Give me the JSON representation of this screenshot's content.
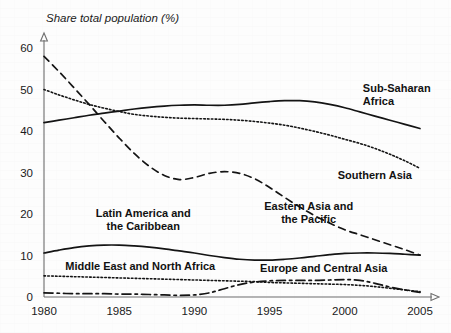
{
  "chart_data": {
    "type": "line",
    "title": "Share total population (%)",
    "xlabel": "",
    "ylabel": "Share total population (%)",
    "xlim": [
      1980,
      2005
    ],
    "ylim": [
      0,
      63
    ],
    "grid": false,
    "legend": "inline-annotations",
    "x_ticks": [
      "1980",
      "1985",
      "1990",
      "1995",
      "2000",
      "2005"
    ],
    "x_tick_values": [
      1980,
      1985,
      1990,
      1995,
      2000,
      2005
    ],
    "y_ticks": [
      "0",
      "10",
      "20",
      "30",
      "40",
      "50",
      "60"
    ],
    "y_tick_values": [
      0,
      10,
      20,
      30,
      40,
      50,
      60
    ],
    "x": [
      1980,
      1981,
      1982,
      1983,
      1984,
      1985,
      1986,
      1987,
      1988,
      1989,
      1990,
      1991,
      1992,
      1993,
      1994,
      1995,
      1996,
      1997,
      1998,
      1999,
      2000,
      2001,
      2002,
      2003,
      2004,
      2005
    ],
    "series": [
      {
        "name": "Sub-Saharan Africa",
        "style": "solid",
        "label_lines": [
          "Sub-Saharan",
          "Africa"
        ],
        "values": [
          42.0,
          42.6,
          43.2,
          43.8,
          44.3,
          44.8,
          45.3,
          45.7,
          46.0,
          46.2,
          46.3,
          46.2,
          46.2,
          46.4,
          46.8,
          47.1,
          47.3,
          47.3,
          47.0,
          46.4,
          45.6,
          44.6,
          43.6,
          42.6,
          41.6,
          40.6
        ]
      },
      {
        "name": "Southern Asia",
        "style": "dotted",
        "label_lines": [
          "Southern Asia"
        ],
        "values": [
          50.0,
          48.7,
          47.5,
          46.4,
          45.5,
          44.7,
          44.0,
          43.6,
          43.3,
          43.1,
          43.0,
          42.9,
          42.8,
          42.6,
          42.3,
          41.9,
          41.4,
          40.7,
          39.9,
          39.0,
          38.0,
          37.0,
          35.8,
          34.4,
          32.8,
          31.0
        ]
      },
      {
        "name": "Eastern Asia and the Pacific",
        "style": "dashed",
        "label_lines": [
          "Eastern Asia and",
          "the Pacific"
        ],
        "values": [
          58.0,
          54.3,
          50.4,
          46.4,
          42.3,
          38.3,
          34.6,
          31.5,
          29.3,
          28.3,
          28.8,
          29.8,
          30.2,
          29.8,
          28.5,
          26.4,
          24.0,
          21.7,
          19.6,
          17.8,
          16.2,
          15.0,
          13.8,
          12.6,
          11.4,
          10.1
        ]
      },
      {
        "name": "Latin America and the Caribbean",
        "style": "solid",
        "label_lines": [
          "Latin America and",
          "the Caribbean"
        ],
        "values": [
          10.6,
          11.3,
          11.9,
          12.3,
          12.5,
          12.5,
          12.3,
          12.0,
          11.6,
          11.1,
          10.6,
          10.0,
          9.5,
          9.1,
          8.9,
          8.9,
          9.1,
          9.4,
          9.8,
          10.2,
          10.5,
          10.6,
          10.6,
          10.5,
          10.3,
          10.1
        ]
      },
      {
        "name": "Middle East and North Africa",
        "style": "dotted",
        "label_lines": [
          "Middle East and North Africa"
        ],
        "values": [
          5.1,
          5.0,
          4.9,
          4.8,
          4.7,
          4.6,
          4.5,
          4.4,
          4.3,
          4.2,
          4.1,
          4.0,
          3.9,
          3.8,
          3.7,
          3.5,
          3.4,
          3.3,
          3.2,
          3.1,
          3.0,
          2.8,
          2.5,
          2.1,
          1.7,
          1.3
        ]
      },
      {
        "name": "Europe and Central Asia",
        "style": "dashdot",
        "label_lines": [
          "Europe and Central Asia"
        ],
        "values": [
          1.0,
          0.9,
          0.8,
          0.8,
          0.8,
          0.7,
          0.7,
          0.6,
          0.5,
          0.4,
          0.5,
          1.0,
          2.0,
          3.0,
          3.6,
          3.9,
          4.0,
          4.0,
          4.0,
          4.1,
          4.2,
          4.0,
          3.3,
          2.4,
          1.7,
          1.1
        ]
      }
    ],
    "annotations": [
      {
        "text": "Sub-Saharan Africa",
        "lines": [
          "Sub-Saharan",
          "Africa"
        ],
        "x": 2001.2,
        "y": 49.5,
        "anchor": "start"
      },
      {
        "text": "Southern Asia",
        "lines": [
          "Southern Asia"
        ],
        "x": 2002.0,
        "y": 28.4,
        "anchor": "middle"
      },
      {
        "text": "Eastern Asia and the Pacific",
        "lines": [
          "Eastern Asia and",
          "the Pacific"
        ],
        "x": 1997.6,
        "y": 21.0,
        "anchor": "middle"
      },
      {
        "text": "Latin America and the Caribbean",
        "lines": [
          "Latin America and",
          "the Caribbean"
        ],
        "x": 1986.6,
        "y": 19.2,
        "anchor": "middle"
      },
      {
        "text": "Middle East and North Africa",
        "lines": [
          "Middle East and North Africa"
        ],
        "x": 1986.4,
        "y": 6.6,
        "anchor": "middle"
      },
      {
        "text": "Europe and Central Asia",
        "lines": [
          "Europe and Central Asia"
        ],
        "x": 1998.6,
        "y": 6.0,
        "anchor": "middle"
      }
    ]
  }
}
